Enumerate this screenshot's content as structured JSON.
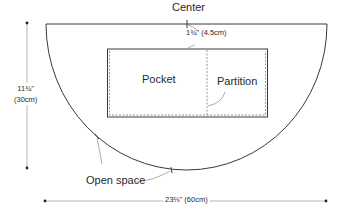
{
  "diagram": {
    "labels": {
      "center": "Center",
      "center_offset": "1¾\" (4.5cm)",
      "pocket": "Pocket",
      "partition": "Partition",
      "height_in": "11¾\"",
      "height_cm": "(30cm)",
      "open_space": "Open space",
      "width": "23⅔\" (60cm)"
    },
    "colors": {
      "line": "#3a3a3a",
      "dim_line": "#9a9a9a",
      "dash": "#6a6a6a"
    }
  }
}
